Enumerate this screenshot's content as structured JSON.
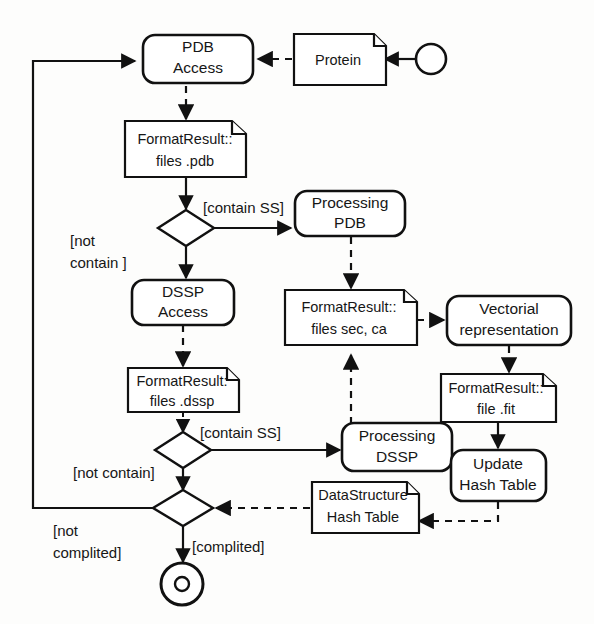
{
  "diagram": {
    "kind": "uml-activity-diagram",
    "colors": {
      "background": "#fdfdfc",
      "stroke": "#111111",
      "fill": "#ffffff",
      "text": "#161616"
    },
    "nodes": {
      "start": {
        "type": "initial-node",
        "label": ""
      },
      "pdb_access": {
        "type": "action",
        "line1": "PDB",
        "line2": "Access"
      },
      "protein": {
        "type": "artifact",
        "line1": "Protein",
        "line2": ""
      },
      "format_pdb": {
        "type": "artifact",
        "line1": "FormatResult::",
        "line2": "files .pdb"
      },
      "decision_pdb": {
        "type": "decision",
        "label": ""
      },
      "processing_pdb": {
        "type": "action",
        "line1": "Processing",
        "line2": "PDB"
      },
      "dssp_access": {
        "type": "action",
        "line1": "DSSP",
        "line2": "Access"
      },
      "format_secca": {
        "type": "artifact",
        "line1": "FormatResult::",
        "line2": "files sec, ca"
      },
      "vectorial": {
        "type": "action",
        "line1": "Vectorial",
        "line2": "representation"
      },
      "format_dssp": {
        "type": "artifact",
        "line1": "FormatResult:",
        "line2": "files .dssp"
      },
      "format_fit": {
        "type": "artifact",
        "line1": "FormatResult::",
        "line2": "file .fit"
      },
      "decision_dssp": {
        "type": "decision",
        "label": ""
      },
      "processing_dssp": {
        "type": "action",
        "line1": "Processing",
        "line2": "DSSP"
      },
      "update_hash": {
        "type": "action",
        "line1": "Update",
        "line2": "Hash Table"
      },
      "merge": {
        "type": "decision",
        "label": ""
      },
      "datastructure_hash": {
        "type": "artifact",
        "line1": "DataStructure",
        "line2": "Hash Table"
      },
      "final": {
        "type": "final-node",
        "label": ""
      }
    },
    "guards": {
      "contain_ss_top": "[contain SS]",
      "not_contain_top_line1": "[not",
      "not_contain_top_line2": "contain ]",
      "contain_ss_bottom": "[contain SS]",
      "not_contain_bottom": "[not contain]",
      "not_complited_line1": "[not",
      "not_complited_line2": "complited]",
      "complited": "[complited]"
    }
  }
}
